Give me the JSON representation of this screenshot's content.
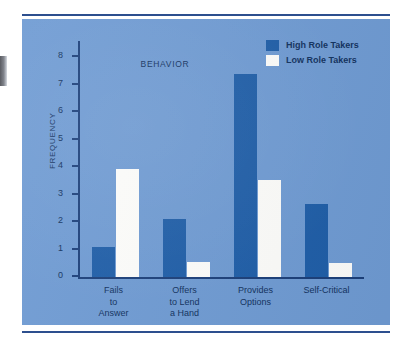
{
  "figure": {
    "background_color": "#6f9bd3",
    "bar_high_color": "#1f5ea8",
    "bar_low_color": "#fdfdfb",
    "text_color": "#12325f"
  },
  "legend": {
    "position": "top-right",
    "entries": [
      {
        "label": "High Role Takers",
        "color": "#1f5ea8"
      },
      {
        "label": "Low Role Takers",
        "color": "#fdfdfb"
      }
    ]
  },
  "chart_data": {
    "type": "bar",
    "title": "",
    "xlabel": "BEHAVIOR",
    "ylabel": "FREQUENCY",
    "ylim": [
      0,
      8.6
    ],
    "yticks": [
      0,
      1,
      2,
      3,
      4,
      5,
      6,
      7,
      8
    ],
    "ytick_labels": [
      "0",
      "1",
      "2",
      "3",
      "4",
      "5",
      "6",
      "7",
      "8"
    ],
    "grid": false,
    "legend_position": "top-right",
    "categories": [
      "Fails\nto\nAnswer",
      "Offers\nto Lend\na Hand",
      "Provides\nOptions",
      "Self-Critical"
    ],
    "category_labels": [
      [
        "Fails",
        "to",
        "Answer"
      ],
      [
        "Offers",
        "to Lend",
        "a Hand"
      ],
      [
        "Provides",
        "Options"
      ],
      [
        "Self-Critical"
      ]
    ],
    "series": [
      {
        "name": "High Role Takers",
        "color": "#1f5ea8",
        "values": [
          1.1,
          2.1,
          7.4,
          2.65
        ]
      },
      {
        "name": "Low Role Takers",
        "color": "#fdfdfb",
        "values": [
          3.95,
          0.55,
          3.55,
          0.5
        ]
      }
    ]
  }
}
